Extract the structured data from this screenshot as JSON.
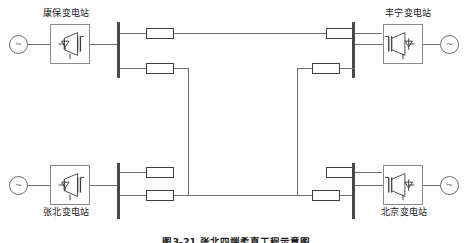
{
  "figure": {
    "caption": "图3-21 张北四端柔直工程示意图",
    "background_color": "#ffffff",
    "wire_color": "#6e6e6e",
    "busbar_color": "#4a4a4a",
    "reactor_border_color": "#3d3d3d",
    "converter_border_color": "#8a8a8a",
    "text_color": "#1a1a1a"
  },
  "stations": [
    {
      "id": "kangbao",
      "label": "康保变电站",
      "position": "top-left",
      "label_placement": "above",
      "converter_symbol": "igbt-converter-icon",
      "source_symbol": "ac-source-icon",
      "source_marking": "~"
    },
    {
      "id": "fengning",
      "label": "丰宁变电站",
      "position": "top-right",
      "label_placement": "above",
      "converter_symbol": "igbt-converter-icon",
      "source_symbol": "ac-source-icon",
      "source_marking": "~"
    },
    {
      "id": "zhangbei",
      "label": "张北变电站",
      "position": "bottom-left",
      "label_placement": "below",
      "converter_symbol": "igbt-converter-icon",
      "source_symbol": "ac-source-icon",
      "source_marking": "~"
    },
    {
      "id": "beijing",
      "label": "北京变电站",
      "position": "bottom-right",
      "label_placement": "below",
      "converter_symbol": "igbt-converter-icon",
      "source_symbol": "ac-source-icon",
      "source_marking": "~"
    }
  ],
  "components": {
    "busbar_name": "dc-busbar",
    "reactor_name": "smoothing-reactor",
    "line_name": "dc-transmission-line",
    "reactor_count": 8,
    "busbar_count": 4
  }
}
